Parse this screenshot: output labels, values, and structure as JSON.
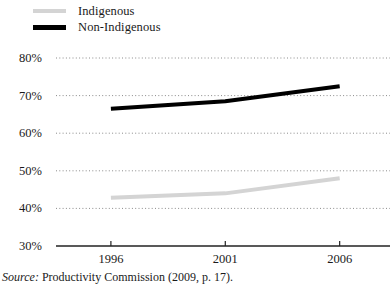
{
  "legend": {
    "position": "top-left",
    "items": [
      {
        "label": "Indigenous",
        "color": "#d4d4d4",
        "style": "solid",
        "swatch": "line-swatch-indigenous"
      },
      {
        "label": "Non-Indigenous",
        "color": "#000000",
        "style": "solid",
        "swatch": "line-swatch-non-indigenous"
      }
    ]
  },
  "source": {
    "prefix": "Source:",
    "text": "Productivity Commission (2009, p. 17)."
  },
  "chart_data": {
    "type": "line",
    "title": "",
    "subtitle": "",
    "xlabel": "",
    "ylabel": "",
    "x": [
      1996,
      2001,
      2006
    ],
    "xlim": [
      1993.6,
      2008.2
    ],
    "ylim": [
      30,
      80
    ],
    "xticks": [
      1996,
      2001,
      2006
    ],
    "xtick_labels": [
      "1996",
      "2001",
      "2006"
    ],
    "yticks": [
      30,
      40,
      50,
      60,
      70,
      80
    ],
    "ytick_labels": [
      "30%",
      "40%",
      "50%",
      "60%",
      "70%",
      "80%"
    ],
    "grid": "horizontal-dotted",
    "legend_position": "above-plot-left",
    "series": [
      {
        "name": "Indigenous",
        "color": "#d4d4d4",
        "width": 4,
        "x": [
          1996,
          2001,
          2006
        ],
        "values": [
          42.8,
          44.0,
          48.0
        ]
      },
      {
        "name": "Non-Indigenous",
        "color": "#000000",
        "width": 4,
        "x": [
          1996,
          2001,
          2006
        ],
        "values": [
          66.5,
          68.5,
          72.5
        ]
      }
    ]
  }
}
